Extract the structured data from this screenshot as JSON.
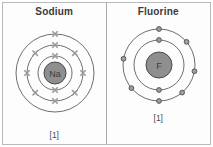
{
  "figure": {
    "panels": [
      {
        "id": "sodium",
        "title": "Sodium",
        "reference_label": "[1]",
        "nucleus_symbol": "Na",
        "electron_marker": "x-mark",
        "shell_count": 3,
        "electron_configuration": [
          2,
          8,
          1
        ],
        "shells": [
          {
            "index": 1,
            "radius": 17,
            "electron_count": 2,
            "electron_angles_deg": [
              270,
              90
            ]
          },
          {
            "index": 2,
            "radius": 28,
            "electron_count": 8,
            "electron_angles_deg": [
              270,
              315,
              0,
              45,
              90,
              135,
              180,
              225
            ]
          },
          {
            "index": 3,
            "radius": 39,
            "electron_count": 1,
            "electron_angles_deg": [
              270
            ]
          }
        ]
      },
      {
        "id": "fluorine",
        "title": "Fluorine",
        "reference_label": "[1]",
        "nucleus_symbol": "F",
        "electron_marker": "open-circle",
        "shell_count": 2,
        "electron_configuration": [
          2,
          7
        ],
        "shells": [
          {
            "index": 1,
            "radius": 25,
            "electron_count": 2,
            "electron_angles_deg": [
              270,
              90
            ]
          },
          {
            "index": 2,
            "radius": 36,
            "electron_count": 7,
            "electron_angles_deg": [
              270,
              320,
              10,
              50,
              90,
              140,
              190
            ]
          }
        ]
      }
    ],
    "colors": {
      "nucleus_fill": "#8f8f8f",
      "shell_stroke": "#5e5e5e",
      "electron_x_stroke": "#9a9a9a",
      "electron_o_fill": "#9e9e9e",
      "frame_border": "#b9b9b9",
      "divider": "#a8a8a8",
      "title_text": "#3a3a3a",
      "background": "#ffffff"
    }
  }
}
